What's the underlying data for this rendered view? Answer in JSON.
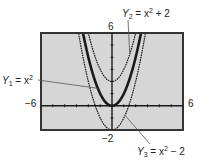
{
  "chart_data": {
    "type": "line",
    "title": "",
    "xlabel": "",
    "ylabel": "",
    "xlim": [
      -6,
      6
    ],
    "ylim": [
      -2,
      6
    ],
    "grid": false,
    "axis_labels": {
      "xmin": "−6",
      "xmax": "6",
      "ymin": "−2",
      "ymax": "6"
    },
    "series": [
      {
        "name": "Y1",
        "label_sub": "1",
        "formula": "x^2",
        "shift": 0,
        "weight": "bold"
      },
      {
        "name": "Y2",
        "label_sub": "2",
        "formula": "x^2 + 2",
        "shift": 2,
        "weight": "normal"
      },
      {
        "name": "Y3",
        "label_sub": "3",
        "formula": "x^2 − 2",
        "shift": -2,
        "weight": "normal"
      }
    ],
    "annotations": [
      {
        "series": "Y1",
        "text_main": "Y",
        "sub": "1",
        "eq": " = x",
        "sup": "2",
        "tail": ""
      },
      {
        "series": "Y2",
        "text_main": "Y",
        "sub": "2",
        "eq": " = x",
        "sup": "2",
        "tail": " + 2"
      },
      {
        "series": "Y3",
        "text_main": "Y",
        "sub": "3",
        "eq": " = x",
        "sup": "2",
        "tail": " − 2"
      }
    ]
  },
  "colors": {
    "screen_bg": "#d6d6d6",
    "frame": "#333333",
    "curve": "#1a1a1a",
    "leader": "#555555"
  }
}
